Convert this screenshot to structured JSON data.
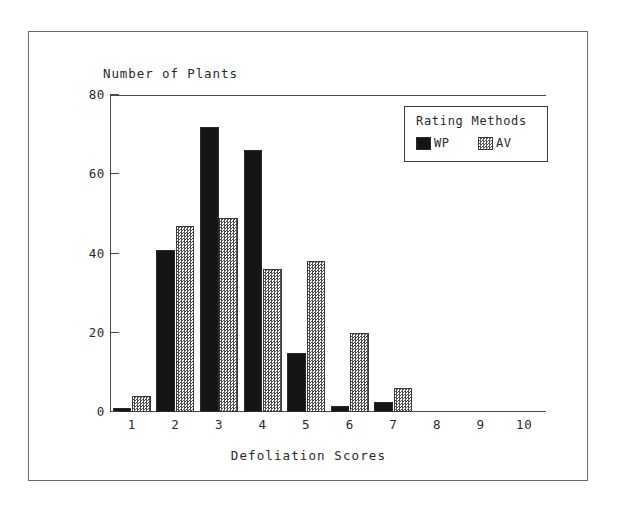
{
  "chart_data": {
    "type": "bar",
    "title": "",
    "xlabel": "Defoliation Scores",
    "ylabel": "Number of Plants",
    "categories": [
      "1",
      "2",
      "3",
      "4",
      "5",
      "6",
      "7",
      "8",
      "9",
      "10"
    ],
    "series": [
      {
        "name": "WP",
        "values": [
          1,
          41,
          72,
          66,
          15,
          1.5,
          2.5,
          0,
          0,
          0
        ],
        "color": "#151515",
        "fill": "solid-black"
      },
      {
        "name": "AV",
        "values": [
          4,
          47,
          49,
          36,
          38,
          20,
          6,
          0,
          0,
          0
        ],
        "color": "#5a5a5a",
        "fill": "checkered-gray"
      }
    ],
    "ylim": [
      0,
      80
    ],
    "yticks": [
      0,
      20,
      40,
      60,
      80
    ],
    "ytick_labels": [
      "0",
      "20",
      "40",
      "60",
      "80"
    ],
    "grid": false,
    "legend_position": "top-right"
  },
  "legend": {
    "title": "Rating Methods",
    "entries": [
      {
        "label": "WP"
      },
      {
        "label": "AV"
      }
    ]
  },
  "axes": {
    "y_caption": "Number of Plants",
    "x_caption": "Defoliation Scores"
  }
}
